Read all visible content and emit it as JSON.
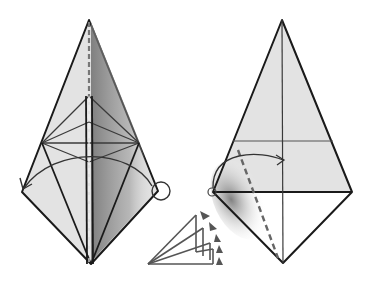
{
  "diagram": {
    "type": "origami-fold-steps",
    "colors": {
      "paper_fill": "#e3e3e3",
      "paper_white": "#ffffff",
      "line": "#1a1a1a",
      "crease": "#4a4a4a",
      "dash": "#666666",
      "shadow": "#7a7a7a",
      "symbol": "#555555"
    },
    "steps": [
      {
        "id": "left-figure",
        "description": "Kite base with inner kite creases, valley-fold arrow from right corner to left corner, dashed vertical mountain crease",
        "markers": [
          "circle-at-right-corner",
          "curved-arrow-to-left-corner",
          "dashed-center-line"
        ]
      },
      {
        "id": "right-figure",
        "description": "Kite shape with horizontal and vertical creases, dashed diagonal fold line, curved arrow from left corner over to center",
        "markers": [
          "circle-at-left-corner",
          "curved-arrow-to-center",
          "dashed-diagonal-line"
        ]
      }
    ],
    "symbol": {
      "id": "repeat-fold-symbol",
      "description": "Stacked fan of layers with arrowheads indicating repeated folding / turning"
    }
  }
}
